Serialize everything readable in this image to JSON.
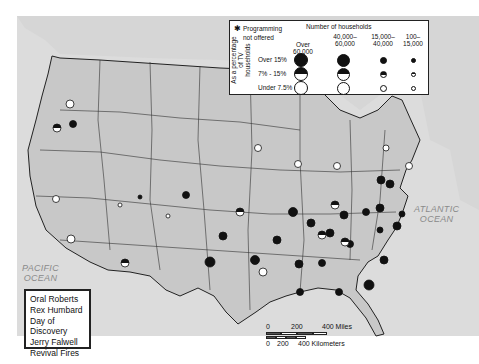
{
  "map": {
    "title": "Televangelism programming audience by market",
    "oceans": {
      "atlantic": [
        "ATLANTIC",
        "OCEAN"
      ],
      "pacific": [
        "PACIFIC",
        "OCEAN"
      ]
    }
  },
  "legend": {
    "star_symbol": "✱",
    "programming_not_offered": [
      "Programming",
      "not offered"
    ],
    "number_of_households_title": "Number of households",
    "household_columns": [
      [
        "Over 60,000"
      ],
      [
        "40,000–",
        "60,000"
      ],
      [
        "15,000–",
        "40,000"
      ],
      [
        "100–",
        "15,000"
      ]
    ],
    "percentage_axis_label": [
      "As a percentage",
      "of TV households"
    ],
    "percentage_rows": [
      "Over 15%",
      "7% - 15%",
      "Under 7.5%"
    ],
    "row_fill": [
      "full",
      "half",
      "empty"
    ],
    "symbol_sizes_px": [
      15,
      13,
      7,
      6
    ]
  },
  "programs_box": {
    "items": [
      "Oral Roberts",
      "Rex Humbard",
      "Day of Discovery",
      "Jerry Falwell",
      "Revival Fires"
    ]
  },
  "scale_bar": {
    "miles_ticks": [
      "0",
      "200",
      "400 Miles"
    ],
    "km_ticks": [
      "0",
      "200",
      "400 Kilometers"
    ]
  },
  "colors": {
    "land": "#c8c8c8",
    "water": "#e6e6e6",
    "canada": "#d9d9d9",
    "border": "#222222",
    "symbol": "#111111"
  }
}
